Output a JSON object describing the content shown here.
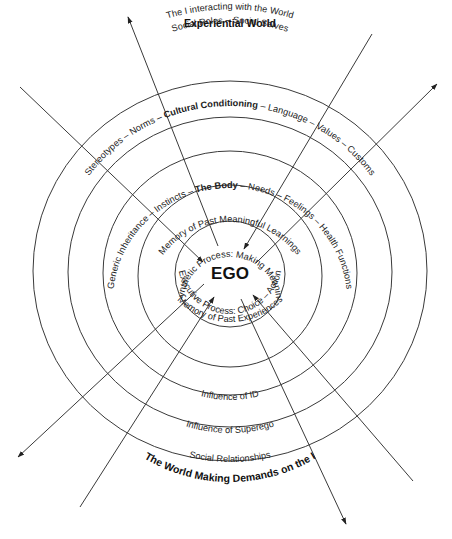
{
  "diagram": {
    "title_top": "Experiential World",
    "title_bottom": "The World Making Demands on the I",
    "center_label": "EGO",
    "outer_label_top": "The I interacting with the World",
    "rings": [
      {
        "id": "ring-1",
        "top_label": "Social Roles – Social Selves",
        "bottom_label": "Social Relationships"
      },
      {
        "id": "ring-2",
        "top_label_parts": [
          {
            "text": "Stereotypes – Norms – ",
            "bold": false
          },
          {
            "text": "Cultural Conditioning",
            "bold": true
          },
          {
            "text": " – Language – Values – Customs",
            "bold": false
          }
        ],
        "bottom_label": "Influence of Superego"
      },
      {
        "id": "ring-3",
        "top_label_parts": [
          {
            "text": "Generic Inheritance – Instincts – ",
            "bold": false
          },
          {
            "text": "The Body",
            "bold": true
          },
          {
            "text": " – Needs – Feelings – Health Functions",
            "bold": false
          }
        ],
        "bottom_label": "Influence of ID"
      },
      {
        "id": "ring-4",
        "top_label": "Memory of Past Meaningful Learnings",
        "bottom_label": "Memory of Past Experiences"
      },
      {
        "id": "ring-5",
        "top_label": "Synthetic Process: Making Meaning",
        "bottom_label": "Executive Process: Choice – Action"
      }
    ],
    "arrows": [
      {
        "id": "arrow-out-upper-left",
        "direction": "outward"
      },
      {
        "id": "arrow-in-from-left",
        "direction": "inward"
      },
      {
        "id": "arrow-in-from-top-right",
        "direction": "inward"
      },
      {
        "id": "arrow-out-upper-right",
        "direction": "outward"
      },
      {
        "id": "arrow-out-lower-left",
        "direction": "outward"
      },
      {
        "id": "arrow-in-from-bottom-left",
        "direction": "inward"
      },
      {
        "id": "arrow-out-bottom",
        "direction": "outward"
      },
      {
        "id": "arrow-in-from-bottom-right",
        "direction": "inward"
      }
    ],
    "colors": {
      "line": "#3a3a3a",
      "text": "#222222",
      "background": "#ffffff"
    }
  }
}
